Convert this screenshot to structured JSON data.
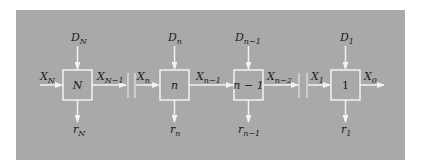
{
  "diagram": {
    "background_color": "#a9a9a9",
    "line_color": "#f2f2f2",
    "stages": [
      {
        "box_label": "N",
        "italic": true,
        "decision": {
          "base": "D",
          "sub": "N"
        },
        "return": {
          "base": "r",
          "sub": "N"
        },
        "input": {
          "base": "X",
          "sub": "N"
        },
        "output": {
          "base": "X",
          "sub": "N−1"
        }
      },
      {
        "box_label": "n",
        "italic": true,
        "decision": {
          "base": "D",
          "sub": "n"
        },
        "return": {
          "base": "r",
          "sub": "n"
        },
        "input": {
          "base": "X",
          "sub": "n"
        },
        "output": {
          "base": "X",
          "sub": "n−1"
        }
      },
      {
        "box_label": "n − 1",
        "italic": true,
        "decision": {
          "base": "D",
          "sub": "n−1"
        },
        "return": {
          "base": "r",
          "sub": "n−1"
        },
        "input": null,
        "output": {
          "base": "X",
          "sub": "n−2"
        }
      },
      {
        "box_label": "1",
        "italic": false,
        "decision": {
          "base": "D",
          "sub": "1"
        },
        "return": {
          "base": "r",
          "sub": "1"
        },
        "input": {
          "base": "X",
          "sub": "1"
        },
        "output": {
          "base": "X",
          "sub": "0"
        }
      }
    ]
  }
}
